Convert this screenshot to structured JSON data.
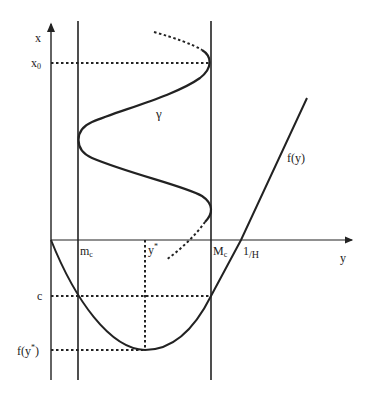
{
  "diagram": {
    "type": "phase-plane sketch",
    "axes": {
      "vertical_label": "x",
      "horizontal_label": "y"
    },
    "labels": {
      "x0": "x",
      "x0_sub": "0",
      "gamma": "γ",
      "fy": "f(y)",
      "mc": "m",
      "mc_sub": "c",
      "Mc": "M",
      "Mc_sub": "c",
      "ystar": "y",
      "ystar_sup": "*",
      "one_over_H": "1",
      "one_over_H_den": "/H",
      "c": "c",
      "f_ystar": "f(y",
      "f_ystar_sup": "*",
      "f_ystar_close": ")"
    },
    "elements": [
      "vertical x-axis with arrow",
      "horizontal y-axis with arrow",
      "vertical line at m_c",
      "vertical line at M_c",
      "curve gamma oscillating between m_c and M_c",
      "convex curve f(y) with minimum at y*",
      "dotted reference lines at x0, c, f(y*), y*"
    ],
    "colors": {
      "ink": "#222222",
      "background": "#ffffff"
    }
  }
}
